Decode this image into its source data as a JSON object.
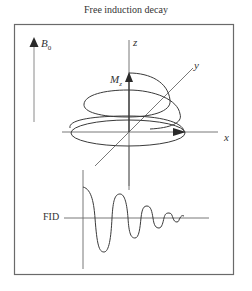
{
  "title": "Free induction decay",
  "labels": {
    "b0": "B",
    "b0_sub": "0",
    "z_axis": "z",
    "y_axis": "y",
    "x_axis": "x",
    "mz": "M",
    "mz_sub": "z",
    "fid": "FID"
  },
  "colors": {
    "stroke": "#4a4a4a",
    "frame": "#6a6a6a",
    "text": "#333333",
    "background": "#ffffff"
  },
  "diagram": {
    "components": [
      "static magnetic field vector B0 pointing up",
      "3D coordinate axes x, y, z",
      "net magnetization Mz spiraling from z-axis down into x-y plane",
      "free induction decay signal: damped oscillation"
    ]
  }
}
